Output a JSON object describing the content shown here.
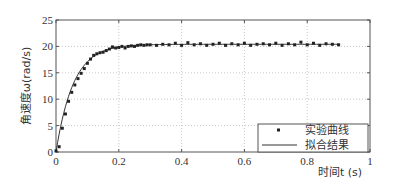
{
  "chart_data": {
    "type": "line",
    "title": "",
    "xlabel": "时间t (s)",
    "ylabel": "角速度ω(rad/s)",
    "xlim": [
      0,
      1
    ],
    "ylim": [
      0,
      25
    ],
    "xticks": [
      "0",
      "0.2",
      "0.4",
      "0.6",
      "0.8",
      "1"
    ],
    "yticks": [
      "0",
      "5",
      "10",
      "15",
      "20",
      "25"
    ],
    "grid": true,
    "legend_position": "lower right",
    "series": [
      {
        "name": "实验曲线",
        "style": "markers",
        "x": [
          0.0,
          0.01,
          0.02,
          0.03,
          0.04,
          0.05,
          0.06,
          0.07,
          0.08,
          0.09,
          0.1,
          0.11,
          0.12,
          0.13,
          0.14,
          0.15,
          0.16,
          0.17,
          0.18,
          0.19,
          0.2,
          0.21,
          0.22,
          0.23,
          0.24,
          0.25,
          0.26,
          0.27,
          0.28,
          0.29,
          0.3,
          0.32,
          0.34,
          0.36,
          0.38,
          0.4,
          0.42,
          0.44,
          0.46,
          0.48,
          0.5,
          0.52,
          0.54,
          0.56,
          0.58,
          0.6,
          0.62,
          0.64,
          0.66,
          0.68,
          0.7,
          0.72,
          0.74,
          0.76,
          0.78,
          0.8,
          0.82,
          0.84,
          0.86,
          0.88,
          0.9
        ],
        "values": [
          0.2,
          1.0,
          4.5,
          7.2,
          9.6,
          11.3,
          12.7,
          13.9,
          14.9,
          15.8,
          16.8,
          17.6,
          18.3,
          18.6,
          18.8,
          18.9,
          19.2,
          19.5,
          19.9,
          19.7,
          19.8,
          20.0,
          19.7,
          20.0,
          20.1,
          20.0,
          20.2,
          20.3,
          20.2,
          20.3,
          20.3,
          20.2,
          20.4,
          20.3,
          20.6,
          20.2,
          20.7,
          20.3,
          20.5,
          20.2,
          20.4,
          20.6,
          20.2,
          20.5,
          20.3,
          20.6,
          20.2,
          20.4,
          20.5,
          20.3,
          20.6,
          20.2,
          20.5,
          20.3,
          20.8,
          20.3,
          20.6,
          20.2,
          20.5,
          20.4,
          20.3
        ]
      },
      {
        "name": "拟合结果",
        "style": "line",
        "model": "20.4*(1-exp(-t/0.055))"
      }
    ]
  },
  "legend": {
    "items": [
      {
        "label": "实验曲线",
        "marker": "dot"
      },
      {
        "label": "拟合结果",
        "marker": "line"
      }
    ]
  },
  "axes": {
    "xlabel": "时间t (s)",
    "ylabel": "角速度ω(rad/s)"
  }
}
